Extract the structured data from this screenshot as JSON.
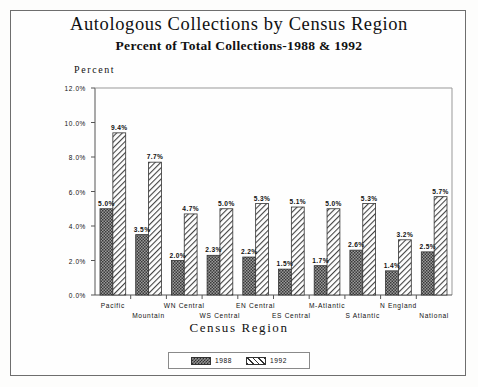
{
  "title": {
    "main": "Autologous Collections by Census Region",
    "sub": "Percent of Total Collections-1988 & 1992"
  },
  "chart_data": {
    "type": "bar",
    "title": "Autologous Collections by Census Region",
    "subtitle": "Percent of Total Collections-1988 & 1992",
    "xlabel": "Census Region",
    "ylabel": "Percent",
    "ylim": [
      0,
      12
    ],
    "ytick_labels": [
      "0.0%",
      "2.0%",
      "4.0%",
      "6.0%",
      "8.0%",
      "10.0%",
      "12.0%"
    ],
    "ytick_values": [
      0,
      2,
      4,
      6,
      8,
      10,
      12
    ],
    "grid": false,
    "legend_position": "bottom",
    "categories": [
      "Pacific",
      "Mountain",
      "WN Central",
      "WS Central",
      "EN Central",
      "ES Central",
      "M-Atlantic",
      "S Atlantic",
      "N England",
      "National"
    ],
    "series": [
      {
        "name": "1988",
        "values": [
          5.0,
          3.5,
          2.0,
          2.3,
          2.2,
          1.5,
          1.7,
          2.6,
          1.4,
          2.5
        ],
        "labels": [
          "5.0%",
          "3.5%",
          "2.0%",
          "2.3%",
          "2.2%",
          "1.5%",
          "1.7%",
          "2.6%",
          "1.4%",
          "2.5%"
        ],
        "pattern": "checker-dark"
      },
      {
        "name": "1992",
        "values": [
          9.4,
          7.7,
          4.7,
          5.0,
          5.3,
          5.1,
          5.0,
          5.3,
          3.2,
          5.7
        ],
        "labels": [
          "9.4%",
          "7.7%",
          "4.7%",
          "5.0%",
          "5.3%",
          "5.1%",
          "5.0%",
          "5.3%",
          "3.2%",
          "5.7%"
        ],
        "pattern": "diagonal-hatch"
      }
    ]
  },
  "legend": {
    "items": [
      {
        "label": "1988"
      },
      {
        "label": "1992"
      }
    ]
  },
  "colors": {
    "series_1988": "#6e6e6e",
    "series_1992": "#ffffff",
    "axis": "#4a4a4a",
    "text": "#111111"
  }
}
